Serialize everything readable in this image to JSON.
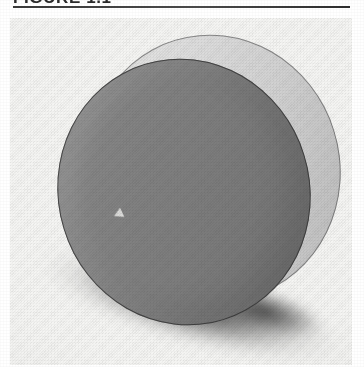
{
  "caption": {
    "label": "FIGURE 1.1",
    "rule_color": "#3a3a3a"
  },
  "panel": {
    "background_color": "#f5f5f3",
    "name": "figure-plate"
  },
  "figure": {
    "parts": {
      "face": {
        "name": "disc-front-face",
        "color": "#808080",
        "outline_color": "#2d2d2d"
      },
      "rim": {
        "name": "disc-side-rim",
        "color": "#dcdcdc",
        "outline_color": "#464646"
      },
      "marker": {
        "name": "face-highlight-marker",
        "color": "#e2e2e0",
        "shape": "triangle"
      },
      "shadow": {
        "name": "cast-shadow",
        "color": "#3c3c3c"
      }
    },
    "tilt_degrees": -17
  }
}
